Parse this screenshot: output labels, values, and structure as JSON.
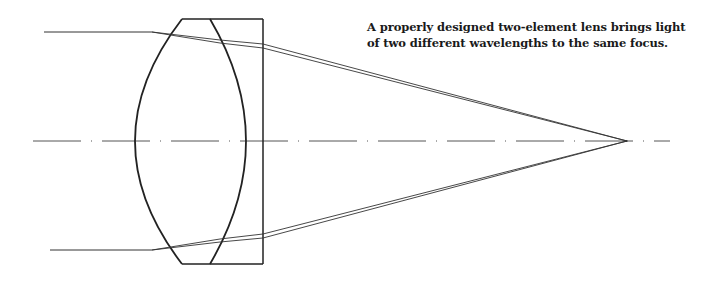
{
  "caption": {
    "text": "A properly designed two-element lens brings light of two different wavelengths to the same focus."
  },
  "diagram": {
    "colors": {
      "stroke": "#222222",
      "ray": "#333333",
      "axis": "#555555",
      "background": "#ffffff"
    },
    "optical_axis": {
      "y": 141,
      "x_start": 33,
      "x_end": 670
    },
    "lens": {
      "top_y": 19,
      "bottom_y": 264,
      "outer_left_apex_x": 135,
      "top_left_corner_x": 182,
      "inner_curve_top_x": 210,
      "inner_curve_apex_x": 245,
      "rect_right_x": 263
    },
    "focus_point": {
      "x": 627,
      "y": 141
    },
    "rays": [
      {
        "name": "top-incoming",
        "y": 32,
        "x_start": 44
      },
      {
        "name": "bottom-incoming",
        "y": 250,
        "x_start": 50
      }
    ]
  }
}
